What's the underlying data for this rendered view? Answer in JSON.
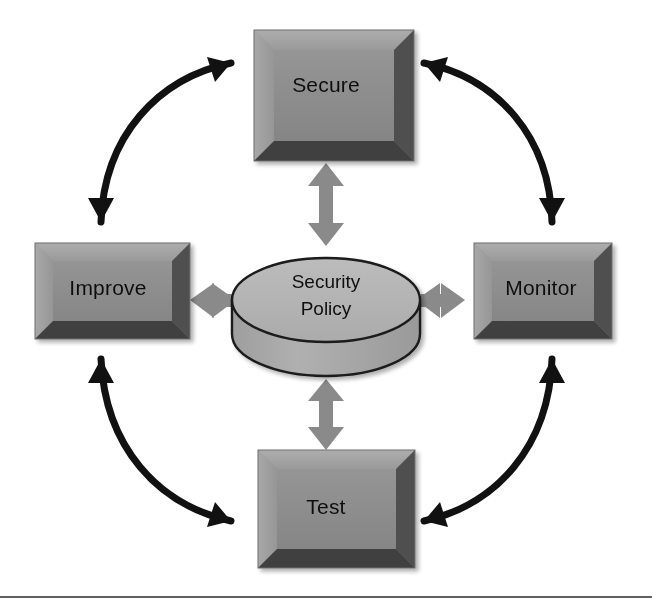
{
  "diagram": {
    "type": "cycle-diagram",
    "background_color": "#ffffff",
    "center": {
      "name": "security-policy",
      "shape": "cylinder",
      "label_line1": "Security",
      "label_line2": "Policy",
      "fill_top": "#b3b3b3",
      "fill_body": "#a8a8a8",
      "stroke": "#1a1a1a",
      "cx": 326,
      "cy": 300,
      "rx": 94,
      "ry": 42,
      "body_height": 34
    },
    "nodes": [
      {
        "id": "secure",
        "name": "node-secure",
        "label": "Secure",
        "position": "top",
        "x": 254,
        "y": 30,
        "width": 160,
        "height": 131,
        "face_color": "#8c8c8c",
        "bevel_light": "#a6a6a6",
        "bevel_dark": "#4d4d4d",
        "text_x": 326,
        "text_y": 86
      },
      {
        "id": "improve",
        "name": "node-improve",
        "label": "Improve",
        "position": "left",
        "x": 35,
        "y": 243,
        "width": 155,
        "height": 96,
        "face_color": "#8c8c8c",
        "bevel_light": "#a6a6a6",
        "bevel_dark": "#4d4d4d",
        "text_x": 108,
        "text_y": 289
      },
      {
        "id": "monitor",
        "name": "node-monitor",
        "label": "Monitor",
        "position": "right",
        "x": 474,
        "y": 243,
        "width": 138,
        "height": 96,
        "face_color": "#8c8c8c",
        "bevel_light": "#a6a6a6",
        "bevel_dark": "#4d4d4d",
        "text_x": 541,
        "text_y": 289
      },
      {
        "id": "test",
        "name": "node-test",
        "label": "Test",
        "position": "bottom",
        "x": 258,
        "y": 450,
        "width": 157,
        "height": 118,
        "face_color": "#8c8c8c",
        "bevel_light": "#a6a6a6",
        "bevel_dark": "#4d4d4d",
        "text_x": 326,
        "text_y": 508
      }
    ],
    "cycle_arrows": [
      {
        "id": "improve-secure",
        "name": "cycle-arrow-improve-secure",
        "from": "improve",
        "to": "secure",
        "quadrant": "top-left",
        "bidirectional": true,
        "color": "#111111"
      },
      {
        "id": "secure-monitor",
        "name": "cycle-arrow-secure-monitor",
        "from": "secure",
        "to": "monitor",
        "quadrant": "top-right",
        "bidirectional": true,
        "color": "#111111"
      },
      {
        "id": "monitor-test",
        "name": "cycle-arrow-monitor-test",
        "from": "monitor",
        "to": "test",
        "quadrant": "bottom-right",
        "bidirectional": true,
        "color": "#111111"
      },
      {
        "id": "test-improve",
        "name": "cycle-arrow-test-improve",
        "from": "test",
        "to": "improve",
        "quadrant": "bottom-left",
        "bidirectional": true,
        "color": "#111111"
      }
    ],
    "spoke_arrows": [
      {
        "id": "policy-secure",
        "name": "spoke-arrow-policy-secure",
        "from": "security-policy",
        "to": "secure",
        "orientation": "vertical",
        "bidirectional": true,
        "color": "#8a8a8a"
      },
      {
        "id": "policy-improve",
        "name": "spoke-arrow-policy-improve",
        "from": "security-policy",
        "to": "improve",
        "orientation": "horizontal",
        "bidirectional": true,
        "color": "#8a8a8a"
      },
      {
        "id": "policy-monitor",
        "name": "spoke-arrow-policy-monitor",
        "from": "security-policy",
        "to": "monitor",
        "orientation": "horizontal",
        "bidirectional": true,
        "color": "#8a8a8a"
      },
      {
        "id": "policy-test",
        "name": "spoke-arrow-policy-test",
        "from": "security-policy",
        "to": "test",
        "orientation": "vertical",
        "bidirectional": true,
        "color": "#8a8a8a"
      }
    ],
    "footer_rule": {
      "name": "footer-divider",
      "y": 597,
      "color": "#2b2b2b"
    }
  }
}
